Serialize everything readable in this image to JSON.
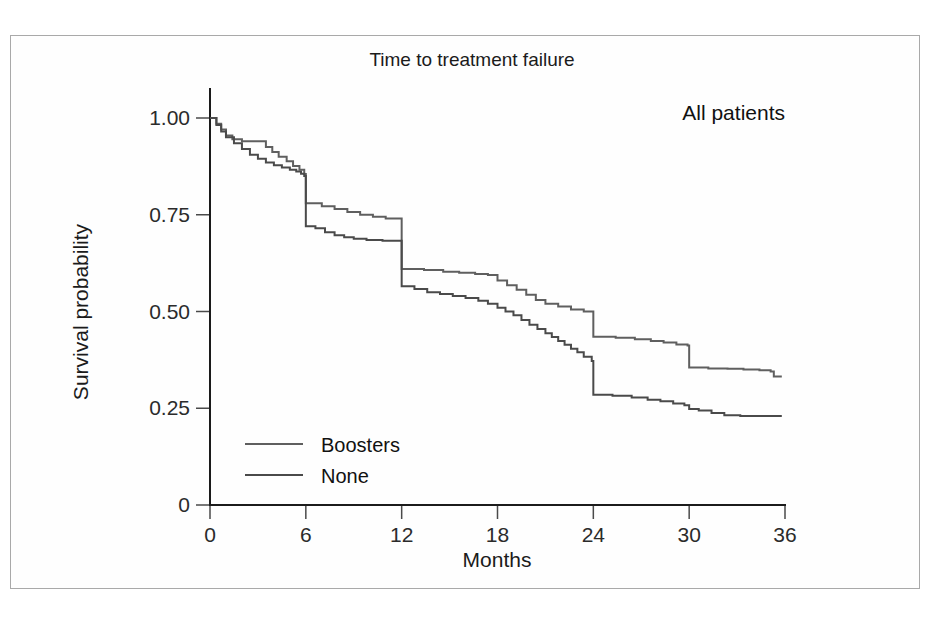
{
  "figure": {
    "panel_annotation": "All patients"
  },
  "chart_data": {
    "type": "line",
    "subtype": "kaplan-meier-step",
    "title": "Time to treatment failure",
    "xlabel": "Months",
    "ylabel": "Survival probability",
    "xlim": [
      0,
      36
    ],
    "ylim": [
      0,
      1.0
    ],
    "xticks": [
      0,
      6,
      12,
      18,
      24,
      30,
      36
    ],
    "xticklabels": [
      "0",
      "6",
      "12",
      "18",
      "24",
      "30",
      "36"
    ],
    "yticks": [
      0,
      0.25,
      0.5,
      0.75,
      1.0
    ],
    "yticklabels": [
      "0",
      "0.25",
      "0.50",
      "0.75",
      "1.00"
    ],
    "grid": false,
    "legend_position": "lower-left-inside",
    "annotations": [
      {
        "text": "All patients",
        "x": 30.5,
        "y": 0.93
      }
    ],
    "series": [
      {
        "name": "Boosters",
        "color": "#5f5f5f",
        "points": [
          [
            0.0,
            1.0
          ],
          [
            0.4,
            0.985
          ],
          [
            0.7,
            0.97
          ],
          [
            1.0,
            0.955
          ],
          [
            1.4,
            0.945
          ],
          [
            2.0,
            0.94
          ],
          [
            3.2,
            0.94
          ],
          [
            3.5,
            0.925
          ],
          [
            3.9,
            0.912
          ],
          [
            4.3,
            0.9
          ],
          [
            4.8,
            0.888
          ],
          [
            5.2,
            0.876
          ],
          [
            5.6,
            0.866
          ],
          [
            5.9,
            0.855
          ],
          [
            6.0,
            0.78
          ],
          [
            6.6,
            0.78
          ],
          [
            7.0,
            0.772
          ],
          [
            7.8,
            0.765
          ],
          [
            8.6,
            0.757
          ],
          [
            9.4,
            0.75
          ],
          [
            10.2,
            0.745
          ],
          [
            11.0,
            0.74
          ],
          [
            11.9,
            0.74
          ],
          [
            12.0,
            0.61
          ],
          [
            13.4,
            0.607
          ],
          [
            14.6,
            0.603
          ],
          [
            15.6,
            0.6
          ],
          [
            16.6,
            0.597
          ],
          [
            17.4,
            0.594
          ],
          [
            18.0,
            0.58
          ],
          [
            18.6,
            0.568
          ],
          [
            19.2,
            0.556
          ],
          [
            19.8,
            0.543
          ],
          [
            20.4,
            0.53
          ],
          [
            21.0,
            0.52
          ],
          [
            21.8,
            0.513
          ],
          [
            22.6,
            0.505
          ],
          [
            23.4,
            0.5
          ],
          [
            23.9,
            0.5
          ],
          [
            24.0,
            0.435
          ],
          [
            25.4,
            0.432
          ],
          [
            26.6,
            0.428
          ],
          [
            27.6,
            0.424
          ],
          [
            28.4,
            0.42
          ],
          [
            29.2,
            0.415
          ],
          [
            29.9,
            0.412
          ],
          [
            30.0,
            0.355
          ],
          [
            31.2,
            0.353
          ],
          [
            32.4,
            0.352
          ],
          [
            33.4,
            0.35
          ],
          [
            34.4,
            0.348
          ],
          [
            35.1,
            0.345
          ],
          [
            35.3,
            0.332
          ],
          [
            35.8,
            0.332
          ]
        ]
      },
      {
        "name": "None",
        "color": "#4a4a4a",
        "points": [
          [
            0.0,
            1.0
          ],
          [
            0.4,
            0.982
          ],
          [
            0.7,
            0.965
          ],
          [
            1.0,
            0.95
          ],
          [
            1.5,
            0.935
          ],
          [
            2.0,
            0.92
          ],
          [
            2.5,
            0.905
          ],
          [
            3.0,
            0.895
          ],
          [
            3.5,
            0.885
          ],
          [
            4.0,
            0.878
          ],
          [
            4.5,
            0.872
          ],
          [
            5.0,
            0.866
          ],
          [
            5.4,
            0.862
          ],
          [
            5.7,
            0.856
          ],
          [
            5.9,
            0.85
          ],
          [
            6.0,
            0.72
          ],
          [
            6.6,
            0.715
          ],
          [
            7.2,
            0.705
          ],
          [
            7.8,
            0.697
          ],
          [
            8.4,
            0.692
          ],
          [
            9.0,
            0.688
          ],
          [
            9.8,
            0.685
          ],
          [
            10.8,
            0.683
          ],
          [
            11.9,
            0.683
          ],
          [
            12.0,
            0.565
          ],
          [
            12.8,
            0.558
          ],
          [
            13.6,
            0.55
          ],
          [
            14.4,
            0.545
          ],
          [
            15.2,
            0.54
          ],
          [
            16.0,
            0.535
          ],
          [
            16.8,
            0.528
          ],
          [
            17.4,
            0.52
          ],
          [
            18.0,
            0.51
          ],
          [
            18.5,
            0.5
          ],
          [
            19.0,
            0.49
          ],
          [
            19.5,
            0.478
          ],
          [
            20.0,
            0.466
          ],
          [
            20.5,
            0.455
          ],
          [
            21.0,
            0.444
          ],
          [
            21.4,
            0.434
          ],
          [
            21.8,
            0.424
          ],
          [
            22.2,
            0.414
          ],
          [
            22.6,
            0.404
          ],
          [
            23.0,
            0.395
          ],
          [
            23.4,
            0.383
          ],
          [
            23.9,
            0.372
          ],
          [
            24.0,
            0.285
          ],
          [
            25.2,
            0.282
          ],
          [
            26.4,
            0.278
          ],
          [
            27.4,
            0.272
          ],
          [
            28.2,
            0.268
          ],
          [
            29.0,
            0.262
          ],
          [
            29.7,
            0.258
          ],
          [
            30.0,
            0.248
          ],
          [
            30.6,
            0.244
          ],
          [
            31.4,
            0.238
          ],
          [
            32.2,
            0.232
          ],
          [
            33.2,
            0.23
          ],
          [
            34.4,
            0.23
          ],
          [
            35.8,
            0.23
          ]
        ]
      }
    ]
  },
  "legend": {
    "items": [
      {
        "label": "Boosters",
        "color": "#5f5f5f"
      },
      {
        "label": "None",
        "color": "#4a4a4a"
      }
    ]
  }
}
